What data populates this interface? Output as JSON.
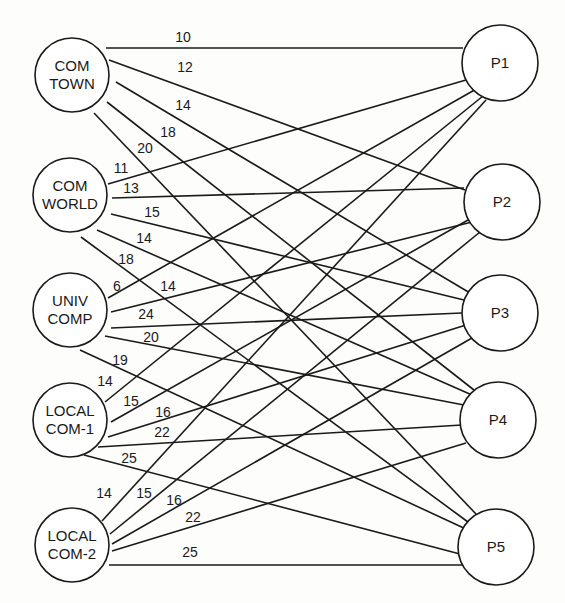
{
  "diagram": {
    "type": "bipartite-graph",
    "style": {
      "line_color": "#1a1a1a",
      "node_fill": "#ffffff",
      "background": "#fdfdfc"
    },
    "sources": [
      {
        "id": "COMTOWN",
        "lines": [
          "COM",
          "TOWN"
        ],
        "cx": 72,
        "cy": 75,
        "r": 37
      },
      {
        "id": "COMWORLD",
        "lines": [
          "COM",
          "WORLD"
        ],
        "cx": 70,
        "cy": 195,
        "r": 37
      },
      {
        "id": "UNIVCOMP",
        "lines": [
          "UNIV",
          "COMP"
        ],
        "cx": 70,
        "cy": 310,
        "r": 37
      },
      {
        "id": "LOCALCOM1",
        "lines": [
          "LOCAL",
          "COM-1"
        ],
        "cx": 70,
        "cy": 420,
        "r": 37
      },
      {
        "id": "LOCALCOM2",
        "lines": [
          "LOCAL",
          "COM-2"
        ],
        "cx": 72,
        "cy": 545,
        "r": 37
      }
    ],
    "targets": [
      {
        "id": "P1",
        "lines": [
          "P1"
        ],
        "cx": 500,
        "cy": 63,
        "r": 38
      },
      {
        "id": "P2",
        "lines": [
          "P2"
        ],
        "cx": 502,
        "cy": 202,
        "r": 38
      },
      {
        "id": "P3",
        "lines": [
          "P3"
        ],
        "cx": 500,
        "cy": 313,
        "r": 38
      },
      {
        "id": "P4",
        "lines": [
          "P4"
        ],
        "cx": 498,
        "cy": 420,
        "r": 38
      },
      {
        "id": "P5",
        "lines": [
          "P5"
        ],
        "cx": 496,
        "cy": 547,
        "r": 38
      }
    ],
    "edges": [
      {
        "from": "COMTOWN",
        "to": "P1",
        "weight": "10",
        "x1": 106,
        "y1": 48,
        "x2": 463,
        "y2": 48,
        "lx": 183,
        "ly": 42
      },
      {
        "from": "COMTOWN",
        "to": "P2",
        "weight": "12",
        "x1": 109,
        "y1": 60,
        "x2": 465,
        "y2": 190,
        "lx": 185,
        "ly": 72
      },
      {
        "from": "COMTOWN",
        "to": "P3",
        "weight": "14",
        "x1": 116,
        "y1": 82,
        "x2": 470,
        "y2": 293,
        "lx": 183,
        "ly": 110
      },
      {
        "from": "COMTOWN",
        "to": "P4",
        "weight": "18",
        "x1": 107,
        "y1": 102,
        "x2": 474,
        "y2": 390,
        "lx": 168,
        "ly": 137
      },
      {
        "from": "COMTOWN",
        "to": "P5",
        "weight": "20",
        "x1": 94,
        "y1": 113,
        "x2": 476,
        "y2": 514,
        "lx": 145,
        "ly": 153
      },
      {
        "from": "COMWORLD",
        "to": "P1",
        "weight": "11",
        "x1": 108,
        "y1": 184,
        "x2": 466,
        "y2": 80,
        "lx": 121,
        "ly": 173
      },
      {
        "from": "COMWORLD",
        "to": "P2",
        "weight": "13",
        "x1": 112,
        "y1": 198,
        "x2": 464,
        "y2": 188,
        "lx": 131,
        "ly": 193
      },
      {
        "from": "COMWORLD",
        "to": "P3",
        "weight": "15",
        "x1": 111,
        "y1": 214,
        "x2": 464,
        "y2": 300,
        "lx": 152,
        "ly": 217
      },
      {
        "from": "COMWORLD",
        "to": "P4",
        "weight": "14",
        "x1": 97,
        "y1": 230,
        "x2": 472,
        "y2": 395,
        "lx": 144,
        "ly": 243
      },
      {
        "from": "COMWORLD",
        "to": "P5",
        "weight": "18",
        "x1": 81,
        "y1": 237,
        "x2": 468,
        "y2": 522,
        "lx": 126,
        "ly": 264
      },
      {
        "from": "UNIVCOMP",
        "to": "P1",
        "weight": "6",
        "x1": 108,
        "y1": 298,
        "x2": 478,
        "y2": 88,
        "lx": 117,
        "ly": 291
      },
      {
        "from": "UNIVCOMP",
        "to": "P2",
        "weight": "14",
        "x1": 111,
        "y1": 312,
        "x2": 472,
        "y2": 222,
        "lx": 168,
        "ly": 291
      },
      {
        "from": "UNIVCOMP",
        "to": "P3",
        "weight": "24",
        "x1": 111,
        "y1": 328,
        "x2": 462,
        "y2": 313,
        "lx": 146,
        "ly": 319
      },
      {
        "from": "UNIVCOMP",
        "to": "P4",
        "weight": "20",
        "x1": 105,
        "y1": 336,
        "x2": 464,
        "y2": 405,
        "lx": 151,
        "ly": 342
      },
      {
        "from": "UNIVCOMP",
        "to": "P5",
        "weight": "19",
        "x1": 80,
        "y1": 350,
        "x2": 468,
        "y2": 530,
        "lx": 120,
        "ly": 365
      },
      {
        "from": "LOCALCOM1",
        "to": "P1",
        "weight": "14",
        "x1": 105,
        "y1": 402,
        "x2": 483,
        "y2": 96,
        "lx": 105,
        "ly": 386
      },
      {
        "from": "LOCALCOM1",
        "to": "P2",
        "weight": "15",
        "x1": 111,
        "y1": 422,
        "x2": 468,
        "y2": 220,
        "lx": 131,
        "ly": 406
      },
      {
        "from": "LOCALCOM1",
        "to": "P3",
        "weight": "16",
        "x1": 108,
        "y1": 437,
        "x2": 466,
        "y2": 325,
        "lx": 163,
        "ly": 417
      },
      {
        "from": "LOCALCOM1",
        "to": "P4",
        "weight": "22",
        "x1": 98,
        "y1": 447,
        "x2": 462,
        "y2": 425,
        "lx": 162,
        "ly": 437
      },
      {
        "from": "LOCALCOM1",
        "to": "P5",
        "weight": "25",
        "x1": 84,
        "y1": 455,
        "x2": 460,
        "y2": 554,
        "lx": 129,
        "ly": 463
      },
      {
        "from": "LOCALCOM2",
        "to": "P1",
        "weight": "14",
        "x1": 102,
        "y1": 521,
        "x2": 486,
        "y2": 100,
        "lx": 104,
        "ly": 498
      },
      {
        "from": "LOCALCOM2",
        "to": "P2",
        "weight": "15",
        "x1": 110,
        "y1": 534,
        "x2": 480,
        "y2": 232,
        "lx": 144,
        "ly": 498
      },
      {
        "from": "LOCALCOM2",
        "to": "P3",
        "weight": "16",
        "x1": 112,
        "y1": 544,
        "x2": 472,
        "y2": 338,
        "lx": 174,
        "ly": 505
      },
      {
        "from": "LOCALCOM2",
        "to": "P4",
        "weight": "22",
        "x1": 112,
        "y1": 551,
        "x2": 466,
        "y2": 443,
        "lx": 193,
        "ly": 522
      },
      {
        "from": "LOCALCOM2",
        "to": "P5",
        "weight": "25",
        "x1": 109,
        "y1": 565,
        "x2": 465,
        "y2": 565,
        "lx": 190,
        "ly": 557
      }
    ]
  }
}
